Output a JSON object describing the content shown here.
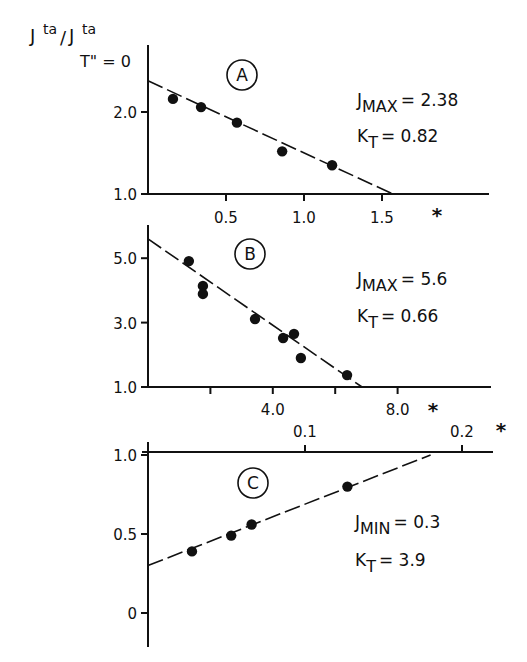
{
  "y_axis_title": {
    "main": "J",
    "sup1": "ta",
    "slash": "/",
    "main2": "J",
    "sup2": "ta",
    "sub2": "T\" = 0"
  },
  "chart_data": [
    {
      "panel": "A",
      "type": "scatter",
      "title": "A",
      "xlabel": "*",
      "ylabel": "Jta/Jta T''=0",
      "x_ticks": [
        0.5,
        1.0,
        1.5
      ],
      "x_tick_labels": [
        "0.5",
        "1.0",
        "1.5"
      ],
      "y_ticks": [
        1.0,
        2.0
      ],
      "y_tick_labels": [
        "1.0",
        "2.0"
      ],
      "xlim": [
        0,
        2.2
      ],
      "ylim": [
        1.0,
        2.6
      ],
      "points": [
        {
          "x": 0.16,
          "y": 2.16
        },
        {
          "x": 0.34,
          "y": 2.06
        },
        {
          "x": 0.57,
          "y": 1.87
        },
        {
          "x": 0.86,
          "y": 1.52
        },
        {
          "x": 1.18,
          "y": 1.35
        }
      ],
      "fit_line": {
        "x0": 0,
        "y0": 2.38,
        "x1": 1.57,
        "y1": 1.0,
        "style": "dashed"
      },
      "annotations": [
        {
          "label": "J",
          "sub": "MAX",
          "value": "= 2.38"
        },
        {
          "label": "K",
          "sub": "T",
          "value": "= 0.82"
        }
      ]
    },
    {
      "panel": "B",
      "type": "scatter",
      "title": "B",
      "xlabel": "*",
      "ylabel": "Jta/Jta T''=0",
      "x_ticks": [
        2.0,
        4.0,
        6.0,
        8.0
      ],
      "x_tick_labels": [
        "",
        "4.0",
        "",
        "8.0"
      ],
      "y_ticks": [
        1.0,
        3.0,
        5.0
      ],
      "y_tick_labels": [
        "1.0",
        "3.0",
        "5.0"
      ],
      "xlim": [
        0,
        11
      ],
      "ylim": [
        1.0,
        6.0
      ],
      "points": [
        {
          "x": 1.31,
          "y": 4.91
        },
        {
          "x": 1.76,
          "y": 4.14
        },
        {
          "x": 1.76,
          "y": 3.89
        },
        {
          "x": 3.43,
          "y": 3.11
        },
        {
          "x": 4.33,
          "y": 2.52
        },
        {
          "x": 4.68,
          "y": 2.65
        },
        {
          "x": 4.9,
          "y": 1.9
        },
        {
          "x": 6.38,
          "y": 1.37
        }
      ],
      "fit_line": {
        "x0": 0,
        "y0": 5.6,
        "x1": 6.86,
        "y1": 1.0,
        "style": "dashed"
      },
      "annotations": [
        {
          "label": "J",
          "sub": "MAX",
          "value": "= 5.6"
        },
        {
          "label": "K",
          "sub": "T",
          "value": "= 0.66"
        }
      ]
    },
    {
      "panel": "C",
      "type": "scatter",
      "title": "C",
      "xlabel": "*",
      "ylabel": "Jta/Jta T''=0",
      "x_ticks": [
        0.1,
        0.2
      ],
      "x_tick_labels": [
        "0.1",
        "0.2"
      ],
      "y_ticks": [
        0,
        0.5,
        1.0
      ],
      "y_tick_labels": [
        "0",
        "0.5",
        "1.0"
      ],
      "xlim": [
        0,
        0.22
      ],
      "ylim": [
        -0.2,
        1.0
      ],
      "points": [
        {
          "x": 0.028,
          "y": 0.39
        },
        {
          "x": 0.053,
          "y": 0.49
        },
        {
          "x": 0.066,
          "y": 0.56
        },
        {
          "x": 0.127,
          "y": 0.8
        }
      ],
      "fit_line": {
        "x0": 0,
        "y0": 0.3,
        "x1": 0.18,
        "y1": 1.0,
        "style": "dashed"
      },
      "annotations": [
        {
          "label": "J",
          "sub": "MIN",
          "value": "= 0.3"
        },
        {
          "label": "K",
          "sub": "T",
          "value": "= 3.9"
        }
      ]
    }
  ],
  "layout": {
    "panels": [
      {
        "origin_x": 148,
        "axis_top": 45,
        "axis_bottom_y": 194,
        "axis_right": 489,
        "x_px_per_unit": 156,
        "y_px_per_unit": 82,
        "y_base": 1.0,
        "x_axis_at_bottom": true,
        "x_tick_dir": "down",
        "x_label_y": 223,
        "star_x": 437,
        "star_y": 222,
        "circle_cx": 242,
        "circle_cy": 75,
        "circle_r": 15,
        "ann_x": 357,
        "ann_y1": 106,
        "ann_y2": 142
      },
      {
        "origin_x": 148,
        "axis_top": 225,
        "axis_bottom_y": 387,
        "axis_right": 491,
        "x_px_per_unit": 31.2,
        "y_px_per_unit": 32.2,
        "y_base": 1.0,
        "x_axis_at_bottom": true,
        "x_tick_dir": "down",
        "x_label_y": 415,
        "star_x": 433,
        "star_y": 417,
        "circle_cx": 250,
        "circle_cy": 254,
        "circle_r": 15,
        "ann_x": 357,
        "ann_y1": 285,
        "ann_y2": 322
      },
      {
        "origin_x": 148,
        "axis_top": 442,
        "axis_bottom_y": 647,
        "axis_right": 493,
        "x_px_per_unit": 1570,
        "y_px_per_unit": 158,
        "y_base": 0,
        "zero_y": 613,
        "x_axis_y": 452,
        "x_axis_at_bottom": false,
        "x_tick_dir": "up",
        "x_label_y": 437,
        "star_x": 501,
        "star_y": 437,
        "circle_cx": 253,
        "circle_cy": 483,
        "circle_r": 15,
        "ann_x": 355,
        "ann_y1": 528,
        "ann_y2": 566
      }
    ]
  }
}
